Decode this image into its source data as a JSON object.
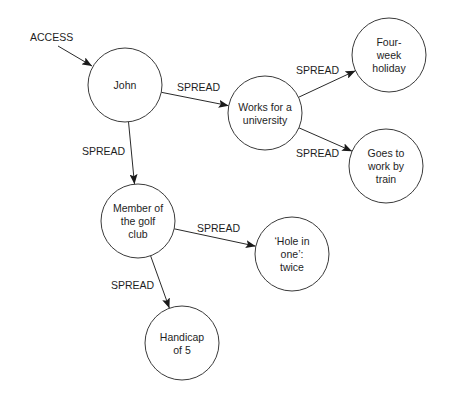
{
  "diagram": {
    "type": "spreading-activation network",
    "entry": {
      "label": "ACCESS",
      "target": "john"
    },
    "nodes": [
      {
        "id": "john",
        "lines": [
          "John"
        ]
      },
      {
        "id": "works",
        "lines": [
          "Works for a",
          "university"
        ]
      },
      {
        "id": "holiday",
        "lines": [
          "Four-",
          "week",
          "holiday"
        ]
      },
      {
        "id": "train",
        "lines": [
          "Goes to",
          "work by",
          "train"
        ]
      },
      {
        "id": "golf",
        "lines": [
          "Member of",
          "the golf",
          "club"
        ]
      },
      {
        "id": "hole",
        "lines": [
          "‘Hole in",
          "one’:",
          "twice"
        ]
      },
      {
        "id": "handicap",
        "lines": [
          "Handicap",
          "of 5"
        ]
      }
    ],
    "edges": [
      {
        "from": "john",
        "to": "works",
        "label": "SPREAD"
      },
      {
        "from": "works",
        "to": "holiday",
        "label": "SPREAD"
      },
      {
        "from": "works",
        "to": "train",
        "label": "SPREAD"
      },
      {
        "from": "john",
        "to": "golf",
        "label": "SPREAD"
      },
      {
        "from": "golf",
        "to": "hole",
        "label": "SPREAD"
      },
      {
        "from": "golf",
        "to": "handicap",
        "label": "SPREAD"
      }
    ]
  }
}
